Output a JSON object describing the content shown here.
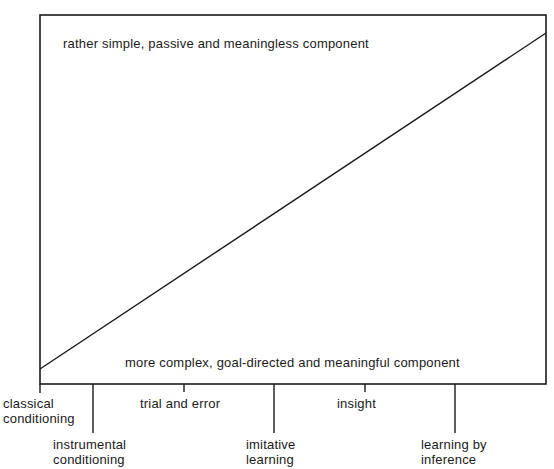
{
  "diagram": {
    "top_label": "rather simple, passive and meaningless component",
    "bottom_label": "more complex, goal-directed and meaningful  component",
    "axis_ticks": [
      {
        "line1": "classical",
        "line2": "conditioning",
        "position": "axis-start",
        "tick": "long"
      },
      {
        "line1": "instrumental",
        "line2": "conditioning",
        "position": "low",
        "tick": "extra-long"
      },
      {
        "line1": "trial and error",
        "line2": "",
        "position": "high",
        "tick": "short"
      },
      {
        "line1": "imitative",
        "line2": "learning",
        "position": "low",
        "tick": "extra-long"
      },
      {
        "line1": "insight",
        "line2": "",
        "position": "high",
        "tick": "short"
      },
      {
        "line1": "learning by",
        "line2": "inference",
        "position": "low",
        "tick": "extra-long"
      }
    ],
    "colors": {
      "ink": "#1a1a1a",
      "background": "#ffffff"
    }
  }
}
